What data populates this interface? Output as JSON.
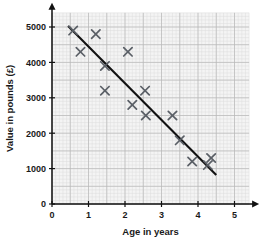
{
  "chart_data": {
    "type": "scatter",
    "title": "",
    "xlabel": "Age in years",
    "ylabel": "Value in pounds (£)",
    "xlim": [
      0,
      5.4
    ],
    "ylim": [
      0,
      5400
    ],
    "xticks": [
      "0",
      "1",
      "2",
      "3",
      "4",
      "5"
    ],
    "xtick_values": [
      0,
      1,
      2,
      3,
      4,
      5
    ],
    "yticks": [
      "0",
      "1000",
      "2000",
      "3000",
      "4000",
      "5000"
    ],
    "ytick_values": [
      0,
      1000,
      2000,
      3000,
      4000,
      5000
    ],
    "grid": true,
    "grid_major_step_x": 0.5,
    "grid_major_step_y": 500,
    "grid_minor_step_x": 0.1,
    "grid_minor_step_y": 100,
    "legend": "none",
    "marker": "x",
    "marker_color": "#5a5f66",
    "points": [
      {
        "x": 0.58,
        "y": 4900
      },
      {
        "x": 0.78,
        "y": 4300
      },
      {
        "x": 1.2,
        "y": 4800
      },
      {
        "x": 1.45,
        "y": 3900
      },
      {
        "x": 1.45,
        "y": 3200
      },
      {
        "x": 2.08,
        "y": 4300
      },
      {
        "x": 2.2,
        "y": 2800
      },
      {
        "x": 2.55,
        "y": 3200
      },
      {
        "x": 2.57,
        "y": 2500
      },
      {
        "x": 3.3,
        "y": 2500
      },
      {
        "x": 3.5,
        "y": 1800
      },
      {
        "x": 3.84,
        "y": 1200
      },
      {
        "x": 4.27,
        "y": 1100
      },
      {
        "x": 4.36,
        "y": 1300
      }
    ],
    "trend_line": {
      "name": "line of best fit",
      "color": "#111111",
      "x_start": 0.44,
      "y_start": 5030,
      "x_end": 4.5,
      "y_end": 820
    },
    "colors": {
      "axis": "#111111",
      "grid_major": "#b8b8b8",
      "grid_minor": "#dcdcdc",
      "plot_background": "#f4f4f4",
      "text": "#1a1a1a"
    }
  }
}
